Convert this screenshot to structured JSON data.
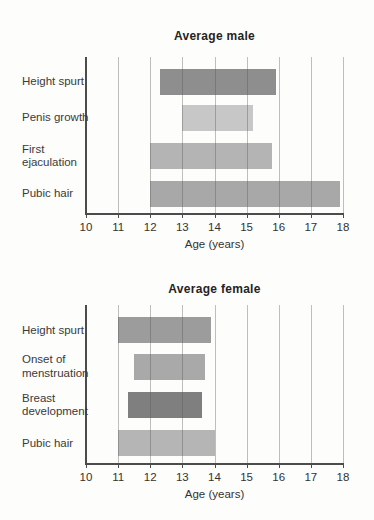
{
  "figure": {
    "background": "#fdfdfc",
    "axis_color": "#4c4c4c",
    "grid_color": "#a9a9a9"
  },
  "chart_data": [
    {
      "type": "bar",
      "variant": "horizontal-range",
      "title": "Average male",
      "xlabel": "Age (years)",
      "xlim": [
        10,
        18
      ],
      "xticks": [
        10,
        11,
        12,
        13,
        14,
        15,
        16,
        17,
        18
      ],
      "grid": true,
      "legend": "none",
      "bars": [
        {
          "label": "Height spurt",
          "start": 12.3,
          "end": 15.9,
          "color": "#8e8e8e"
        },
        {
          "label": "Penis growth",
          "start": 13.0,
          "end": 15.2,
          "color": "#c7c7c7"
        },
        {
          "label": "First\nejaculation",
          "start": 12.0,
          "end": 15.8,
          "color": "#b4b4b4"
        },
        {
          "label": "Pubic hair",
          "start": 12.0,
          "end": 17.9,
          "color": "#a8a8a8"
        }
      ]
    },
    {
      "type": "bar",
      "variant": "horizontal-range",
      "title": "Average female",
      "xlabel": "Age (years)",
      "xlim": [
        10,
        18
      ],
      "xticks": [
        10,
        11,
        12,
        13,
        14,
        15,
        16,
        17,
        18
      ],
      "grid": true,
      "legend": "none",
      "bars": [
        {
          "label": "Height spurt",
          "start": 11.0,
          "end": 13.9,
          "color": "#9c9c9c"
        },
        {
          "label": "Onset of\nmenstruation",
          "start": 11.5,
          "end": 13.7,
          "color": "#a9a9a9"
        },
        {
          "label": "Breast\ndevelopment",
          "start": 11.3,
          "end": 13.6,
          "color": "#7f7f7f"
        },
        {
          "label": "Pubic hair",
          "start": 11.0,
          "end": 14.0,
          "color": "#b5b5b5"
        }
      ]
    }
  ]
}
